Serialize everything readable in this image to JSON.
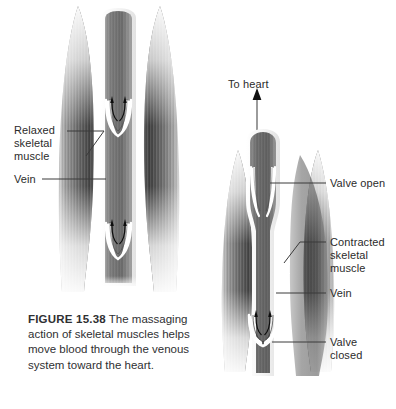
{
  "figure": {
    "number": "FIGURE 15.38",
    "caption_body": "The massaging action of skeletal muscles helps move blood through the venous system toward the heart.",
    "background_color": "#ffffff",
    "text_color": "#2b2b2b",
    "muscle_color_dark": "#4a4a4a",
    "muscle_color_mid": "#8d8d8d",
    "muscle_color_light": "#e8e8e8",
    "vein_color_dark": "#6f6f6f",
    "vein_color_light": "#b9b9b9",
    "tendon_color": "#f2f2f2",
    "valve_outline_color": "#ffffff",
    "arrow_color": "#101010",
    "leader_color": "#3a3a3a"
  },
  "panels": [
    {
      "id": "left-panel",
      "name": "relaxed-muscle-panel",
      "state": "relaxed",
      "valve_state": "valves along vein, blood flowing upward",
      "labels": [
        {
          "id": "relaxed-skeletal-muscle",
          "text": "Relaxed\nskeletal\nmuscle",
          "x": 14,
          "y": 124
        },
        {
          "id": "vein-left",
          "text": "Vein",
          "x": 14,
          "y": 173
        }
      ]
    },
    {
      "id": "right-panel",
      "name": "contracted-muscle-panel",
      "state": "contracted",
      "valve_state": "upper valve open, lower valve closed",
      "labels": [
        {
          "id": "to-heart",
          "text": "To heart",
          "x": 228,
          "y": 78
        },
        {
          "id": "valve-open",
          "text": "Valve open",
          "x": 330,
          "y": 177
        },
        {
          "id": "contracted-skeletal-muscle",
          "text": "Contracted\nskeletal\nmuscle",
          "x": 330,
          "y": 236
        },
        {
          "id": "vein-right",
          "text": "Vein",
          "x": 330,
          "y": 287
        },
        {
          "id": "valve-closed",
          "text": "Valve\nclosed",
          "x": 330,
          "y": 336
        }
      ]
    }
  ],
  "icons": {
    "to_heart_arrow": "up-arrow-icon",
    "blood_flow_arrow": "blood-flow-arrow-icon"
  }
}
